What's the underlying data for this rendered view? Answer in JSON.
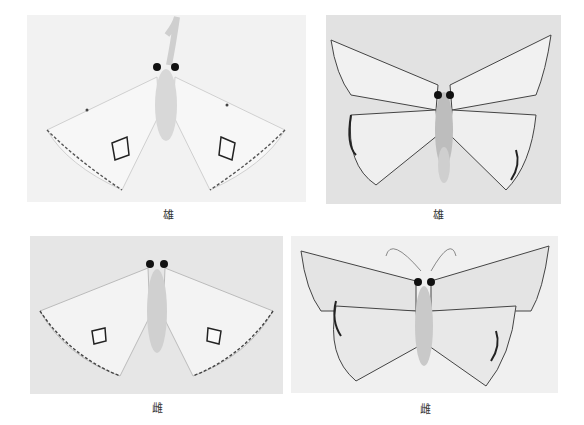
{
  "figure": {
    "panels": [
      {
        "id": "p1",
        "caption": "雄",
        "subject": "moth specimen, dorsal view, wings spread"
      },
      {
        "id": "p2",
        "caption": "雄",
        "subject": "moth specimen, dorsal view, wings spread"
      },
      {
        "id": "p3",
        "caption": "雌",
        "subject": "moth specimen, dorsal view, wings spread"
      },
      {
        "id": "p4",
        "caption": "雌",
        "subject": "moth specimen, dorsal view, wings spread"
      }
    ],
    "colors": {
      "background": "#ffffff",
      "wing": "#e8e8e8",
      "wing_margin": "#3a3a3a",
      "body": "#cfcfcf",
      "eye": "#111111"
    }
  }
}
